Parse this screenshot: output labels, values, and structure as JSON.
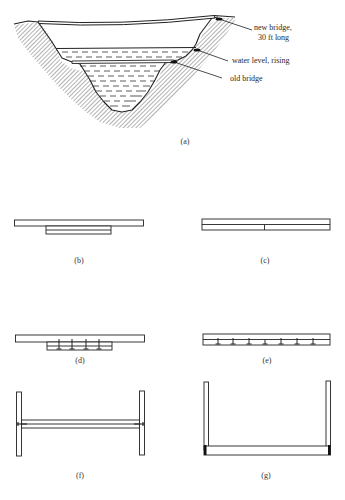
{
  "figure": {
    "panel_a": {
      "label": "(a)",
      "callouts": {
        "new_bridge_line1": "new bridge,",
        "new_bridge_line2": "30 ft long",
        "water_level": "water level, rising",
        "old_bridge": "old bridge"
      }
    },
    "panel_b": {
      "label": "(b)"
    },
    "panel_c": {
      "label": "(c)"
    },
    "panel_d": {
      "label": "(d)"
    },
    "panel_e": {
      "label": "(e)"
    },
    "panel_f": {
      "label": "(f)"
    },
    "panel_g": {
      "label": "(g)"
    }
  },
  "colors": {
    "ink": "#222222",
    "hatch": "#555555",
    "background": "#ffffff"
  }
}
